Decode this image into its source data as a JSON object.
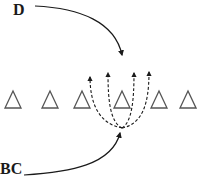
{
  "diagram": {
    "labels": {
      "top": "D",
      "bottom": "BC"
    },
    "colors": {
      "stroke": "#1a1a1a",
      "triangle": "#555555",
      "background": "#ffffff"
    },
    "triangles": {
      "count": 6,
      "centers_x": [
        13,
        50,
        82,
        122,
        159,
        188
      ],
      "base_y": 108,
      "apex_y": 91
    },
    "arrows": {
      "from_d": {
        "style": "solid",
        "start": [
          35,
          6
        ],
        "end": [
          122,
          55
        ]
      },
      "from_bc": {
        "style": "solid",
        "start": [
          24,
          175
        ],
        "end": [
          120,
          133
        ]
      },
      "fan": {
        "style": "dashed",
        "origin": [
          122,
          128
        ],
        "tips": [
          [
            90,
            77
          ],
          [
            108,
            73
          ],
          [
            134,
            73
          ],
          [
            149,
            72
          ]
        ]
      }
    }
  }
}
